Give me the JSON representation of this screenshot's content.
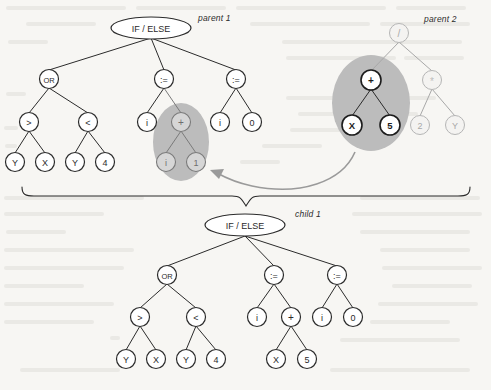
{
  "figure": {
    "background_color": "#f7f6f3",
    "ink_color": "#2b2b2b",
    "highlight_color": "#b9b9b9",
    "faded_color": "#c9c9c9",
    "arrow_color": "#8f8f8f",
    "labels": {
      "parent1": "parent 1",
      "parent2": "parent 2",
      "child1": "child 1"
    }
  },
  "trees": {
    "parent1": {
      "name": "parent 1",
      "root": "IF / ELSE",
      "nodes": [
        {
          "id": "p1-root",
          "label": "IF / ELSE",
          "shape": "ellipse",
          "x": 151,
          "y": 28,
          "state": "normal"
        },
        {
          "id": "p1-or",
          "label": "OR",
          "shape": "circle",
          "x": 49,
          "y": 79,
          "state": "normal"
        },
        {
          "id": "p1-a1",
          "label": ":=",
          "shape": "circle",
          "x": 164,
          "y": 79,
          "state": "normal"
        },
        {
          "id": "p1-a2",
          "label": ":=",
          "shape": "circle",
          "x": 236,
          "y": 79,
          "state": "normal"
        },
        {
          "id": "p1-gt",
          "label": ">",
          "shape": "circle",
          "x": 29,
          "y": 122,
          "state": "normal"
        },
        {
          "id": "p1-lt",
          "label": "<",
          "shape": "circle",
          "x": 88,
          "y": 122,
          "state": "normal"
        },
        {
          "id": "p1-i1",
          "label": "i",
          "shape": "circle",
          "x": 147,
          "y": 122,
          "state": "normal"
        },
        {
          "id": "p1-plus",
          "label": "+",
          "shape": "circle",
          "x": 181,
          "y": 122,
          "state": "selected"
        },
        {
          "id": "p1-i2",
          "label": "i",
          "shape": "circle",
          "x": 220,
          "y": 122,
          "state": "normal"
        },
        {
          "id": "p1-zero",
          "label": "0",
          "shape": "circle",
          "x": 252,
          "y": 122,
          "state": "normal"
        },
        {
          "id": "p1-Y1",
          "label": "Y",
          "shape": "circle",
          "x": 15,
          "y": 162,
          "state": "normal"
        },
        {
          "id": "p1-X1",
          "label": "X",
          "shape": "circle",
          "x": 45,
          "y": 162,
          "state": "normal"
        },
        {
          "id": "p1-Y2",
          "label": "Y",
          "shape": "circle",
          "x": 75,
          "y": 162,
          "state": "normal"
        },
        {
          "id": "p1-4",
          "label": "4",
          "shape": "circle",
          "x": 105,
          "y": 162,
          "state": "normal"
        },
        {
          "id": "p1-i3",
          "label": "i",
          "shape": "circle",
          "x": 166,
          "y": 162,
          "state": "selected"
        },
        {
          "id": "p1-one",
          "label": "1",
          "shape": "circle",
          "x": 196,
          "y": 162,
          "state": "selected"
        }
      ],
      "edges": [
        [
          "p1-root",
          "p1-or"
        ],
        [
          "p1-root",
          "p1-a1"
        ],
        [
          "p1-root",
          "p1-a2"
        ],
        [
          "p1-or",
          "p1-gt"
        ],
        [
          "p1-or",
          "p1-lt"
        ],
        [
          "p1-a1",
          "p1-i1"
        ],
        [
          "p1-a1",
          "p1-plus"
        ],
        [
          "p1-a2",
          "p1-i2"
        ],
        [
          "p1-a2",
          "p1-zero"
        ],
        [
          "p1-gt",
          "p1-Y1"
        ],
        [
          "p1-gt",
          "p1-X1"
        ],
        [
          "p1-lt",
          "p1-Y2"
        ],
        [
          "p1-lt",
          "p1-4"
        ],
        [
          "p1-plus",
          "p1-i3"
        ],
        [
          "p1-plus",
          "p1-one"
        ]
      ],
      "highlight": {
        "cx": 181,
        "cy": 142,
        "rx": 28,
        "ry": 38
      },
      "expression": "IF/ELSE( OR( Y > X, Y < 4 ), i := i + 1, i := 0 )"
    },
    "parent2": {
      "name": "parent 2",
      "root": "/",
      "nodes": [
        {
          "id": "p2-root",
          "label": "/",
          "shape": "circle",
          "x": 399,
          "y": 33,
          "state": "faded"
        },
        {
          "id": "p2-plus",
          "label": "+",
          "shape": "circle",
          "x": 371,
          "y": 80,
          "state": "selected-dark"
        },
        {
          "id": "p2-mul",
          "label": "*",
          "shape": "circle",
          "x": 432,
          "y": 80,
          "state": "faded"
        },
        {
          "id": "p2-X",
          "label": "X",
          "shape": "circle",
          "x": 352,
          "y": 125,
          "state": "selected-dark"
        },
        {
          "id": "p2-5",
          "label": "5",
          "shape": "circle",
          "x": 390,
          "y": 125,
          "state": "selected-dark"
        },
        {
          "id": "p2-2",
          "label": "2",
          "shape": "circle",
          "x": 420,
          "y": 125,
          "state": "faded"
        },
        {
          "id": "p2-Y",
          "label": "Y",
          "shape": "circle",
          "x": 455,
          "y": 125,
          "state": "faded"
        }
      ],
      "edges": [
        [
          "p2-root",
          "p2-plus"
        ],
        [
          "p2-root",
          "p2-mul"
        ],
        [
          "p2-plus",
          "p2-X"
        ],
        [
          "p2-plus",
          "p2-5"
        ],
        [
          "p2-mul",
          "p2-2"
        ],
        [
          "p2-mul",
          "p2-Y"
        ]
      ],
      "highlight": {
        "cx": 371,
        "cy": 104,
        "rx": 39,
        "ry": 48
      },
      "expression": "( X + 5 ) / ( 2 * Y )"
    },
    "child1": {
      "name": "child 1",
      "root": "IF / ELSE",
      "nodes": [
        {
          "id": "c1-root",
          "label": "IF / ELSE",
          "shape": "ellipse",
          "x": 245,
          "y": 225,
          "state": "normal"
        },
        {
          "id": "c1-or",
          "label": "OR",
          "shape": "circle",
          "x": 167,
          "y": 275,
          "state": "normal"
        },
        {
          "id": "c1-a1",
          "label": ":=",
          "shape": "circle",
          "x": 274,
          "y": 275,
          "state": "normal"
        },
        {
          "id": "c1-a2",
          "label": ":=",
          "shape": "circle",
          "x": 337,
          "y": 275,
          "state": "normal"
        },
        {
          "id": "c1-gt",
          "label": ">",
          "shape": "circle",
          "x": 140,
          "y": 317,
          "state": "normal"
        },
        {
          "id": "c1-lt",
          "label": "<",
          "shape": "circle",
          "x": 196,
          "y": 317,
          "state": "normal"
        },
        {
          "id": "c1-i1",
          "label": "i",
          "shape": "circle",
          "x": 257,
          "y": 317,
          "state": "normal"
        },
        {
          "id": "c1-plus",
          "label": "+",
          "shape": "circle",
          "x": 291,
          "y": 317,
          "state": "normal"
        },
        {
          "id": "c1-i2",
          "label": "i",
          "shape": "circle",
          "x": 322,
          "y": 317,
          "state": "normal"
        },
        {
          "id": "c1-zero",
          "label": "0",
          "shape": "circle",
          "x": 353,
          "y": 317,
          "state": "normal"
        },
        {
          "id": "c1-Y1",
          "label": "Y",
          "shape": "circle",
          "x": 126,
          "y": 359,
          "state": "normal"
        },
        {
          "id": "c1-X1",
          "label": "X",
          "shape": "circle",
          "x": 156,
          "y": 359,
          "state": "normal"
        },
        {
          "id": "c1-Y2",
          "label": "Y",
          "shape": "circle",
          "x": 186,
          "y": 359,
          "state": "normal"
        },
        {
          "id": "c1-4",
          "label": "4",
          "shape": "circle",
          "x": 216,
          "y": 359,
          "state": "normal"
        },
        {
          "id": "c1-X2",
          "label": "X",
          "shape": "circle",
          "x": 276,
          "y": 359,
          "state": "normal"
        },
        {
          "id": "c1-5",
          "label": "5",
          "shape": "circle",
          "x": 307,
          "y": 359,
          "state": "normal"
        }
      ],
      "edges": [
        [
          "c1-root",
          "c1-or"
        ],
        [
          "c1-root",
          "c1-a1"
        ],
        [
          "c1-root",
          "c1-a2"
        ],
        [
          "c1-or",
          "c1-gt"
        ],
        [
          "c1-or",
          "c1-lt"
        ],
        [
          "c1-a1",
          "c1-i1"
        ],
        [
          "c1-a1",
          "c1-plus"
        ],
        [
          "c1-a2",
          "c1-i2"
        ],
        [
          "c1-a2",
          "c1-zero"
        ],
        [
          "c1-gt",
          "c1-Y1"
        ],
        [
          "c1-gt",
          "c1-X1"
        ],
        [
          "c1-lt",
          "c1-Y2"
        ],
        [
          "c1-lt",
          "c1-4"
        ],
        [
          "c1-plus",
          "c1-X2"
        ],
        [
          "c1-plus",
          "c1-5"
        ]
      ],
      "expression": "IF/ELSE( OR( Y > X, Y < 4 ), i := X + 5, i := 0 )"
    }
  },
  "annotations": {
    "crossover_arrow": {
      "name": "crossover-arrow",
      "from": "parent2-highlight",
      "to": "parent1-highlight",
      "path": "M 352 150 C 330 196, 250 200, 214 173"
    },
    "brace": {
      "name": "combining-brace",
      "left": 22,
      "right": 470,
      "tip_x": 246,
      "y": 188
    }
  }
}
